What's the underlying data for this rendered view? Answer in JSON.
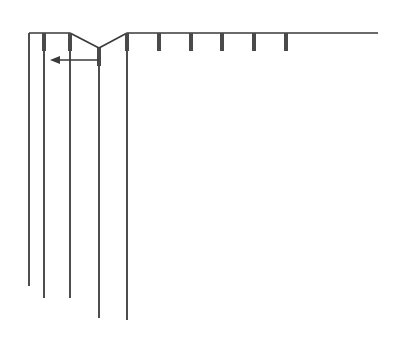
{
  "diagram": {
    "colors": {
      "background": "#ffffff",
      "thin_line": "#3a3a3a",
      "thick_line": "#4a4a4a"
    },
    "top_line": {
      "x1": 29,
      "x2": 378,
      "y": 33
    },
    "v_notch": {
      "left_x": 70,
      "bottom_x": 99,
      "bottom_y": 48,
      "right_x": 127
    },
    "vertical_lines": [
      {
        "x": 29,
        "y1": 33,
        "y2": 286,
        "thick_top": false
      },
      {
        "x": 44,
        "y1": 33,
        "y2": 298,
        "thick_top": true
      },
      {
        "x": 70,
        "y1": 33,
        "y2": 298,
        "thick_top": true
      },
      {
        "x": 99,
        "y1": 48,
        "y2": 318,
        "thick_top": true
      },
      {
        "x": 127,
        "y1": 33,
        "y2": 320,
        "thick_top": true
      }
    ],
    "ticks": [
      {
        "x": 159,
        "y1": 33,
        "y2": 51
      },
      {
        "x": 191,
        "y1": 33,
        "y2": 51
      },
      {
        "x": 222,
        "y1": 33,
        "y2": 51
      },
      {
        "x": 254,
        "y1": 33,
        "y2": 51
      },
      {
        "x": 286,
        "y1": 33,
        "y2": 51
      }
    ],
    "arrow": {
      "x_from": 99,
      "x_to": 50,
      "y": 60,
      "direction": "left"
    }
  }
}
